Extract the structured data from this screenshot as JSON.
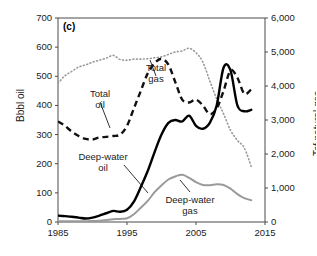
{
  "chart_data": {
    "type": "line",
    "title": "",
    "panel_label": "(c)",
    "xlabel": "",
    "ylabel": "Bbbl oil",
    "ylabel_right": "Tcf natural gas",
    "xlim": [
      1985,
      2015
    ],
    "ylim": [
      0,
      700
    ],
    "ylim_right": [
      0,
      6000
    ],
    "xticks": [
      1985,
      1995,
      2005,
      2015
    ],
    "xtick_labels": [
      "1985",
      "1995",
      "2005",
      "2015"
    ],
    "yticks": [
      0,
      100,
      200,
      300,
      400,
      500,
      600,
      700
    ],
    "ytick_labels": [
      "0",
      "100",
      "200",
      "300",
      "400",
      "500",
      "600",
      "700"
    ],
    "yticks_right": [
      0,
      1000,
      2000,
      3000,
      4000,
      5000,
      6000
    ],
    "ytick_labels_right": [
      "0",
      "1,000",
      "2,000",
      "3,000",
      "4,000",
      "5,000",
      "6,000"
    ],
    "grid": false,
    "legend": "none",
    "annotations": [
      {
        "text_line1": "Total",
        "text_line2": "gas",
        "x": 156,
        "y": 63
      },
      {
        "text_line1": "Total",
        "text_line2": "oil",
        "x": 100,
        "y": 89
      },
      {
        "text_line1": "Deep-water",
        "text_line2": "oil",
        "x": 103,
        "y": 152
      },
      {
        "text_line1": "Deep-water",
        "text_line2": "gas",
        "x": 190,
        "y": 195
      }
    ],
    "series": [
      {
        "name": "Total gas",
        "axis": "right",
        "style": "dotted",
        "color": "#9a9a9a",
        "x": [
          1985,
          1986,
          1987,
          1988,
          1989,
          1990,
          1991,
          1992,
          1993,
          1994,
          1995,
          1996,
          1997,
          1998,
          1999,
          2000,
          2001,
          2002,
          2003,
          2004,
          2005,
          2006,
          2007,
          2008,
          2009,
          2010,
          2011,
          2012,
          2013
        ],
        "values": [
          4080,
          4300,
          4430,
          4560,
          4620,
          4700,
          4760,
          4820,
          4900,
          4780,
          4760,
          4790,
          4790,
          4800,
          4830,
          4860,
          4930,
          5000,
          5030,
          5110,
          4980,
          4700,
          4150,
          3620,
          3180,
          2700,
          2400,
          2180,
          1640
        ]
      },
      {
        "name": "Total oil",
        "axis": "left",
        "style": "dashed",
        "color": "#111111",
        "x": [
          1985,
          1986,
          1987,
          1988,
          1989,
          1990,
          1991,
          1992,
          1993,
          1994,
          1995,
          1996,
          1997,
          1998,
          1999,
          2000,
          2001,
          2002,
          2003,
          2004,
          2005,
          2006,
          2007,
          2008,
          2009,
          2010,
          2011,
          2012,
          2013
        ],
        "values": [
          345,
          330,
          310,
          295,
          285,
          283,
          290,
          292,
          295,
          300,
          330,
          390,
          450,
          510,
          545,
          560,
          540,
          480,
          420,
          410,
          420,
          400,
          370,
          390,
          450,
          520,
          495,
          440,
          455
        ]
      },
      {
        "name": "Deep-water oil",
        "axis": "left",
        "style": "solid",
        "color": "#000000",
        "x": [
          1985,
          1986,
          1987,
          1988,
          1989,
          1990,
          1991,
          1992,
          1993,
          1994,
          1995,
          1996,
          1997,
          1998,
          1999,
          2000,
          2001,
          2002,
          2003,
          2004,
          2005,
          2006,
          2007,
          2008,
          2009,
          2010,
          2011,
          2012,
          2013
        ],
        "values": [
          22,
          20,
          18,
          15,
          12,
          15,
          22,
          30,
          38,
          35,
          42,
          70,
          120,
          175,
          240,
          300,
          340,
          350,
          345,
          365,
          330,
          320,
          340,
          400,
          530,
          520,
          400,
          380,
          385
        ]
      },
      {
        "name": "Deep-water gas",
        "axis": "right",
        "style": "solid",
        "color": "#9a9a9a",
        "x": [
          1985,
          1986,
          1987,
          1988,
          1989,
          1990,
          1991,
          1992,
          1993,
          1994,
          1995,
          1996,
          1997,
          1998,
          1999,
          2000,
          2001,
          2002,
          2003,
          2004,
          2005,
          2006,
          2007,
          2008,
          2009,
          2010,
          2011,
          2012,
          2013
        ],
        "values": [
          20,
          20,
          20,
          20,
          20,
          30,
          40,
          60,
          80,
          90,
          110,
          230,
          420,
          620,
          880,
          1080,
          1250,
          1340,
          1390,
          1300,
          1170,
          1090,
          1080,
          1110,
          1090,
          980,
          820,
          700,
          640
        ]
      }
    ]
  }
}
